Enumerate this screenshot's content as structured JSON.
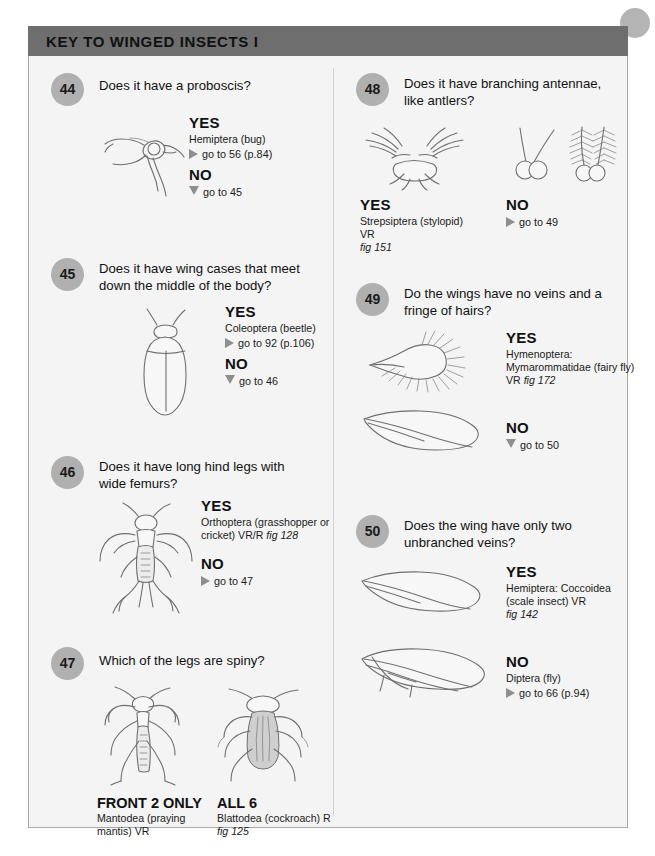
{
  "header": {
    "title": "KEY TO WINGED INSECTS I"
  },
  "labels": {
    "yes": "YES",
    "no": "NO",
    "front_2_only": "FRONT 2 ONLY",
    "all_6": "ALL 6"
  },
  "entries": [
    {
      "number": "44",
      "question": "Does it have a proboscis?",
      "yes": {
        "head": "YES",
        "name": "Hemiptera (bug)",
        "goto": "go to 56 (p.84)",
        "marker": "triangle-right"
      },
      "no": {
        "head": "NO",
        "goto": "go to 45",
        "marker": "triangle-down"
      },
      "art": "bug-proboscis"
    },
    {
      "number": "45",
      "question": "Does it have wing cases that meet down the middle of the body?",
      "yes": {
        "head": "YES",
        "name": "Coleoptera (beetle)",
        "goto": "go to 92 (p.106)",
        "marker": "triangle-right"
      },
      "no": {
        "head": "NO",
        "goto": "go to 46",
        "marker": "triangle-down"
      },
      "art": "beetle"
    },
    {
      "number": "46",
      "question": "Does it have long hind legs with wide femurs?",
      "yes": {
        "head": "YES",
        "name": "Orthoptera (grasshopper or cricket) VR/R ",
        "fig": "fig 128",
        "marker": null
      },
      "no": {
        "head": "NO",
        "goto": "go to 47",
        "marker": "triangle-right"
      },
      "art": "grasshopper"
    },
    {
      "number": "47",
      "question": "Which of the legs are spiny?",
      "choices": [
        {
          "head": "FRONT 2 ONLY",
          "name": "Mantodea (praying mantis) VR",
          "fig": "",
          "art": "mantis"
        },
        {
          "head": "ALL 6",
          "name": "Blattodea (cockroach) R ",
          "fig": "fig 125",
          "art": "cockroach"
        }
      ]
    },
    {
      "number": "48",
      "question": "Does it have branching antennae, like antlers?",
      "choices": [
        {
          "head": "YES",
          "name": "Strepsiptera (stylopid) VR ",
          "fig": "fig 151",
          "art": "branched-antennae"
        },
        {
          "head": "NO",
          "goto": "go to 49",
          "marker": "triangle-right",
          "art": "plain-antennae"
        }
      ]
    },
    {
      "number": "49",
      "question": "Do the wings have no veins and a fringe of hairs?",
      "yes": {
        "head": "YES",
        "name": "Hymenoptera: Mymarommatidae (fairy fly) VR ",
        "fig": "fig 172",
        "marker": null
      },
      "no": {
        "head": "NO",
        "goto": "go to 50",
        "marker": "triangle-down"
      },
      "art": "fairy-fly-wing"
    },
    {
      "number": "50",
      "question": "Does the wing have only two unbranched veins?",
      "yes": {
        "head": "YES",
        "name": "Hemiptera: Coccoidea (scale insect) VR",
        "fig": "fig 142",
        "marker": null
      },
      "no": {
        "head": "NO",
        "name": "Diptera (fly)",
        "goto": "go to 66 (p.94)",
        "marker": "triangle-right"
      },
      "art": "scale-wing"
    }
  ]
}
